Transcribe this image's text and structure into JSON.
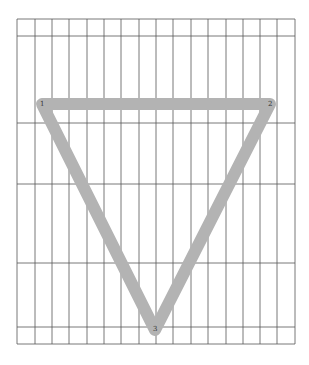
{
  "grid": {
    "left": 17,
    "right": 295,
    "top": 19,
    "bottom": 344,
    "vertical_lines": [
      17,
      35,
      52,
      69,
      87,
      104,
      121,
      139,
      156,
      173,
      191,
      208,
      226,
      243,
      260,
      277,
      295
    ],
    "horizontal_lines": [
      19,
      36,
      123,
      184,
      263,
      327,
      344
    ],
    "line_color": "#555555"
  },
  "triangle": {
    "stroke_color": "#b3b3b3",
    "stroke_width": 12,
    "vertices": [
      {
        "label": "1",
        "x": 42,
        "y": 104
      },
      {
        "label": "2",
        "x": 270,
        "y": 104
      },
      {
        "label": "3",
        "x": 155,
        "y": 330
      }
    ]
  }
}
